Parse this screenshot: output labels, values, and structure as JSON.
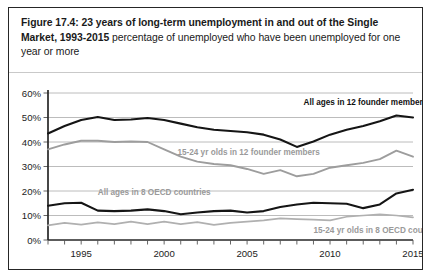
{
  "figure": {
    "title_bold": "Figure 17.4: 23 years of long-term unemployment in and out of the Single Market, 1993-2015",
    "title_rest": " percentage of unemployed who have been unemployed for one year or more"
  },
  "chart_data": {
    "type": "line",
    "title": "Figure 17.4: 23 years of long-term unemployment in and out of the Single Market, 1993-2015",
    "subtitle": "percentage of unemployed who have been unemployed for one year or more",
    "xlabel": "",
    "ylabel": "",
    "xlim": [
      1993,
      2015
    ],
    "ylim": [
      0,
      60
    ],
    "ytick_labels": [
      "0%",
      "10%",
      "20%",
      "30%",
      "40%",
      "50%",
      "60%"
    ],
    "ytick_values": [
      0,
      10,
      20,
      30,
      40,
      50,
      60
    ],
    "xtick_labels": [
      "1995",
      "2000",
      "2005",
      "2010",
      "2015"
    ],
    "xtick_values": [
      1995,
      2000,
      2005,
      2010,
      2015
    ],
    "grid": "horizontal",
    "legend_position": "inline-annotations",
    "x": [
      1993,
      1994,
      1995,
      1996,
      1997,
      1998,
      1999,
      2000,
      2001,
      2002,
      2003,
      2004,
      2005,
      2006,
      2007,
      2008,
      2009,
      2010,
      2011,
      2012,
      2013,
      2014,
      2015
    ],
    "series": [
      {
        "name": "All ages in 12 founder member countries",
        "color": "#151515",
        "annotation": "All ages in 12 founder member countries",
        "values": [
          43.5,
          46.5,
          49.0,
          50.2,
          49.0,
          49.2,
          49.8,
          49.0,
          47.5,
          46.0,
          45.0,
          44.5,
          44.0,
          43.0,
          41.0,
          38.0,
          40.2,
          43.0,
          45.0,
          46.5,
          48.5,
          50.8,
          50.0
        ]
      },
      {
        "name": "15-24 yr olds in 12 founder members",
        "color": "#9d9d9d",
        "annotation": "15-24 yr olds in 12 founder members",
        "values": [
          37.0,
          39.0,
          40.5,
          40.5,
          40.0,
          40.2,
          40.0,
          37.0,
          34.0,
          32.0,
          31.0,
          30.5,
          29.0,
          27.0,
          28.5,
          26.0,
          27.0,
          29.5,
          30.5,
          31.5,
          33.0,
          36.5,
          34.0
        ]
      },
      {
        "name": "All ages in 8 OECD countries",
        "color": "#151515",
        "annotation": "All ages in 8 OECD countries",
        "values": [
          14.0,
          15.0,
          15.2,
          12.0,
          11.8,
          12.0,
          12.5,
          11.8,
          10.5,
          11.2,
          11.8,
          12.0,
          11.2,
          11.8,
          13.5,
          14.5,
          15.2,
          15.0,
          14.8,
          13.0,
          14.5,
          19.0,
          20.5
        ]
      },
      {
        "name": "15-24 yr olds in 8 OECD countries",
        "color": "#b0b0b0",
        "annotation": "15-24 yr olds in 8 OECD countries",
        "values": [
          6.0,
          7.0,
          6.3,
          7.2,
          6.5,
          7.5,
          6.5,
          7.5,
          6.5,
          7.3,
          6.2,
          7.0,
          7.5,
          8.0,
          8.8,
          8.5,
          8.3,
          8.0,
          9.5,
          10.0,
          10.5,
          10.0,
          9.2
        ]
      }
    ],
    "annotations": [
      {
        "text": "All ages in 12 founder member countries",
        "x": 2008.4,
        "y": 55.0,
        "style": "dark"
      },
      {
        "text": "15-24 yr olds in 12 founder members",
        "x": 2000.8,
        "y": 34.6,
        "style": "grey"
      },
      {
        "text": "All ages in 8 OECD countries",
        "x": 1996.0,
        "y": 18.2,
        "style": "grey"
      },
      {
        "text": "15-24 yr olds in 8 OECD countries",
        "x": 2009.0,
        "y": 3.0,
        "style": "grey"
      }
    ]
  }
}
